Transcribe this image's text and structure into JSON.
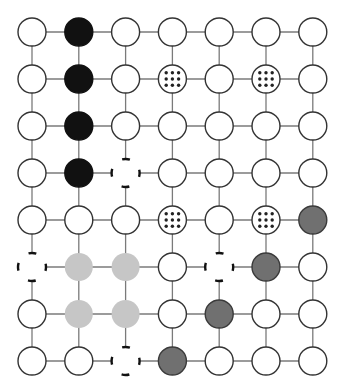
{
  "grid": {
    "rows": 8,
    "cols": 7,
    "origin_x": 32,
    "origin_y": 32,
    "spacing_x": 46.8,
    "spacing_y": 47,
    "radius": 14
  },
  "colors": {
    "line": "#7a7a7a",
    "outline": "#333333",
    "white": "#ffffff",
    "black": "#111111",
    "dark_gray": "#707070",
    "dark_gray_border": "#3a3a3a",
    "light_gray": "#c6c6c6",
    "dot": "#222222"
  },
  "legend_types": [
    "white",
    "black",
    "dotted",
    "dashed",
    "light",
    "dark"
  ],
  "nodes": [
    [
      "white",
      "black",
      "white",
      "white",
      "white",
      "white",
      "white"
    ],
    [
      "white",
      "black",
      "white",
      "dotted",
      "white",
      "dotted",
      "white"
    ],
    [
      "white",
      "black",
      "white",
      "white",
      "white",
      "white",
      "white"
    ],
    [
      "white",
      "black",
      "dashed",
      "white",
      "white",
      "white",
      "white"
    ],
    [
      "white",
      "white",
      "white",
      "dotted",
      "white",
      "dotted",
      "dark"
    ],
    [
      "dashed",
      "light",
      "light",
      "white",
      "dashed",
      "dark",
      "white"
    ],
    [
      "white",
      "light",
      "light",
      "white",
      "dark",
      "white",
      "white"
    ],
    [
      "white",
      "white",
      "dashed",
      "dark",
      "white",
      "white",
      "white"
    ]
  ]
}
